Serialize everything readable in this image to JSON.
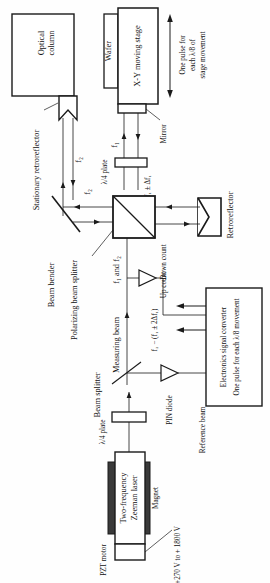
{
  "diagram": {
    "orientation": "rotated-90-ccw",
    "background_color": "#fefefe",
    "line_color": "#1a1a1a",
    "magnet_fill": "#3a3a3a"
  },
  "blocks": {
    "optical_column": {
      "line1": "Optical",
      "line2": "column"
    },
    "wafer": {
      "label": "Wafer"
    },
    "xy_stage": {
      "label": "X-Y moving stage"
    },
    "laser": {
      "line1": "Two-frequency",
      "line2": "Zeeman laser"
    },
    "electronics": {
      "line1": "Electronics signal converter",
      "line2": "One pulse for each λ/8 movement"
    }
  },
  "labels": {
    "stationary_retroreflector": "Stationary retroreflector",
    "mirror": "Mirror",
    "retroreflector": "Retroreflector",
    "beam_bender": "Beam bender",
    "polarizing_beam_splitter": "Polarizing beam splitter",
    "beam_splitter": "Beam splitter",
    "quarter_wave_plate_upper": "λ/4 plate",
    "quarter_wave_plate_lower": "λ/4 plate",
    "pin_diode": "PIN diode",
    "reference_beam": "Reference beam",
    "measuring_beam": "Measuring beam",
    "magnet": "Magnet",
    "pzt_motor": "PZT motor",
    "pzt_voltage": "+270 V to + 1800 V",
    "stage_note": {
      "line1": "One pulse for",
      "line2": "each λ/8 of",
      "line3": "stage movement"
    },
    "up_count": "Up count",
    "down_count": "Down count"
  },
  "beam_labels": {
    "f2_upper": "f₂",
    "f2_lower": "f₂",
    "f1_upper": "f₁",
    "f1_delta": "f₁ ± Δf₁",
    "f1_and_f2": "f₁ and f₂",
    "beat_signal": "f₂ − (f₁ ± 2Δf₁)"
  }
}
